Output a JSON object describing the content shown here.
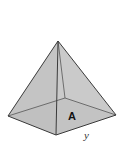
{
  "diagram": {
    "type": "square-pyramid",
    "labels": {
      "base_face": "A",
      "edge": "y"
    },
    "colors": {
      "face": "#c8c8c8",
      "face_dark": "#b4b4b4",
      "edge": "#3a3a3a",
      "hidden_edge": "#555555",
      "background": "#ffffff"
    },
    "vertices": {
      "apex": [
        58,
        41
      ],
      "left": [
        8,
        116
      ],
      "front": [
        56,
        135
      ],
      "right": [
        116,
        115
      ],
      "back": [
        65,
        98
      ]
    }
  }
}
